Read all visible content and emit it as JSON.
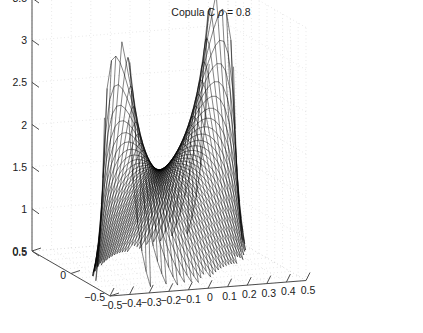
{
  "figure": {
    "title_prefix": "Copula C",
    "title_symbol": "ρ",
    "title_equals": "= 0.8",
    "title_full": "Copula C ρ = 0.8",
    "background_color": "#ffffff",
    "mesh_color": "#000000",
    "axis_color": "#4d4d4d",
    "grid_color": "#c8c8c8",
    "text_color": "#1a1a1a"
  },
  "axes": {
    "z": {
      "ticks": [
        "0.5",
        "1",
        "1.5",
        "2",
        "2.5",
        "3",
        "3.5"
      ],
      "min": 0.5,
      "max": 3.5,
      "step": 0.5
    },
    "y": {
      "ticks": [
        "0.5",
        "0",
        "-0.5"
      ],
      "labels": [
        "0.5",
        "0",
        "−0.5"
      ],
      "min": -0.5,
      "max": 0.5,
      "step": 0.5
    },
    "x": {
      "ticks": [
        "-0.5",
        "-0.4",
        "-0.3",
        "-0.2",
        "-0.1",
        "0",
        "0.1",
        "0.2",
        "0.3",
        "0.4",
        "0.5"
      ],
      "labels": [
        "−0.5",
        "−0.4",
        "−0.3",
        "−0.2",
        "−0.1",
        "0",
        "0.1",
        "0.2",
        "0.3",
        "0.4",
        "0.5"
      ],
      "min": -0.5,
      "max": 0.5,
      "step": 0.1
    }
  },
  "chart_data": {
    "type": "line",
    "plot_kind": "3d-mesh-surface",
    "title": "Copula C ρ = 0.8",
    "xlabel": "",
    "ylabel": "",
    "zlabel": "",
    "xlim": [
      -0.5,
      0.5
    ],
    "ylim": [
      -0.5,
      0.5
    ],
    "zlim": [
      0.5,
      3.5
    ],
    "grid": true,
    "legend": "none",
    "parameters": {
      "rho": 0.8,
      "copula": "C"
    },
    "xticks": [
      -0.5,
      -0.4,
      -0.3,
      -0.2,
      -0.1,
      0,
      0.1,
      0.2,
      0.3,
      0.4,
      0.5
    ],
    "yticks": [
      -0.5,
      0,
      0.5
    ],
    "zticks": [
      0.5,
      1,
      1.5,
      2,
      2.5,
      3,
      3.5
    ],
    "mesh_nx": 45,
    "mesh_ny": 45,
    "surface_z_min": 0.5,
    "surface_z_max": 3.3,
    "view": {
      "azimuth": -37.5,
      "elevation": 30
    },
    "series": [
      {
        "name": "copula density c(u,v)",
        "x": [
          -0.5,
          -0.4,
          -0.3,
          -0.2,
          -0.1,
          0.0,
          0.1,
          0.2,
          0.3,
          0.4,
          0.5
        ],
        "y": [
          -0.5,
          -0.4,
          -0.3,
          -0.2,
          -0.1,
          0.0,
          0.1,
          0.2,
          0.3,
          0.4,
          0.5
        ],
        "z_matrix": [
          [
            3.3,
            2.45,
            1.8,
            1.32,
            0.98,
            0.76,
            0.62,
            0.55,
            0.52,
            0.51,
            0.55
          ],
          [
            2.45,
            2.05,
            1.66,
            1.32,
            1.05,
            0.85,
            0.71,
            0.62,
            0.57,
            0.56,
            0.6
          ],
          [
            1.8,
            1.66,
            1.48,
            1.28,
            1.09,
            0.93,
            0.8,
            0.71,
            0.66,
            0.64,
            0.68
          ],
          [
            1.32,
            1.32,
            1.28,
            1.2,
            1.1,
            0.99,
            0.89,
            0.81,
            0.76,
            0.74,
            0.78
          ],
          [
            0.98,
            1.05,
            1.09,
            1.1,
            1.08,
            1.04,
            0.98,
            0.92,
            0.88,
            0.86,
            0.9
          ],
          [
            0.76,
            0.85,
            0.93,
            0.99,
            1.04,
            1.06,
            1.06,
            1.04,
            1.02,
            1.02,
            1.06
          ],
          [
            0.62,
            0.71,
            0.8,
            0.89,
            0.98,
            1.06,
            1.12,
            1.17,
            1.2,
            1.24,
            1.32
          ],
          [
            0.55,
            0.62,
            0.71,
            0.81,
            0.92,
            1.04,
            1.17,
            1.3,
            1.44,
            1.6,
            1.8
          ],
          [
            0.52,
            0.57,
            0.66,
            0.76,
            0.88,
            1.02,
            1.2,
            1.44,
            1.72,
            2.05,
            2.45
          ],
          [
            0.51,
            0.56,
            0.64,
            0.74,
            0.86,
            1.02,
            1.24,
            1.6,
            2.05,
            2.62,
            3.3
          ],
          [
            0.55,
            0.6,
            0.68,
            0.78,
            0.9,
            1.06,
            1.32,
            1.8,
            2.45,
            3.3,
            3.3
          ]
        ]
      }
    ]
  }
}
